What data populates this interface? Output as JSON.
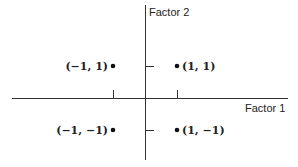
{
  "diagram": {
    "x_axis_label": "Factor 1",
    "y_axis_label": "Factor 2",
    "points": [
      {
        "label": "(−1, 1)",
        "x": -1,
        "y": 1
      },
      {
        "label": "(1, 1)",
        "x": 1,
        "y": 1
      },
      {
        "label": "(−1, −1)",
        "x": -1,
        "y": -1
      },
      {
        "label": "(1, −1)",
        "x": 1,
        "y": -1
      }
    ]
  }
}
